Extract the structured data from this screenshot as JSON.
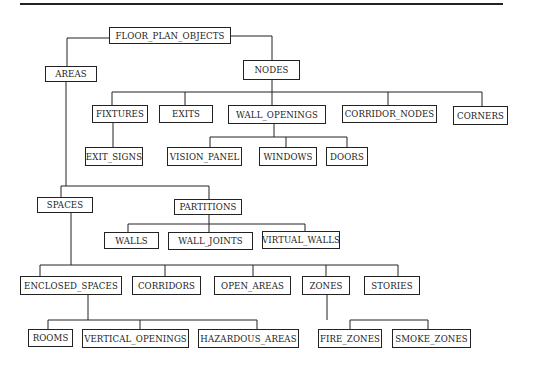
{
  "diagram": {
    "type": "hierarchy-tree",
    "line_color": "#222222",
    "nodes": [
      {
        "id": "floor_plan_objects",
        "label": "FLOOR_PLAN_OBJECTS",
        "x": 109,
        "y": 27,
        "w": 122,
        "h": 17,
        "parent": null
      },
      {
        "id": "areas",
        "label": "AREAS",
        "x": 45,
        "y": 66,
        "w": 52,
        "h": 16,
        "parent": "floor_plan_objects"
      },
      {
        "id": "nodes",
        "label": "NODES",
        "x": 243,
        "y": 60,
        "w": 57,
        "h": 20,
        "parent": "floor_plan_objects"
      },
      {
        "id": "fixtures",
        "label": "FIXTURES",
        "x": 92,
        "y": 105,
        "w": 56,
        "h": 18,
        "parent": "nodes"
      },
      {
        "id": "exits",
        "label": "EXITS",
        "x": 159,
        "y": 105,
        "w": 54,
        "h": 18,
        "parent": "nodes"
      },
      {
        "id": "wall_openings",
        "label": "WALL_OPENINGS",
        "x": 228,
        "y": 105,
        "w": 98,
        "h": 19,
        "parent": "nodes"
      },
      {
        "id": "corridor_nodes",
        "label": "CORRIDOR_NODES",
        "x": 342,
        "y": 105,
        "w": 95,
        "h": 18,
        "parent": "nodes"
      },
      {
        "id": "corners",
        "label": "CORNERS",
        "x": 453,
        "y": 106,
        "w": 55,
        "h": 19,
        "parent": "nodes",
        "thick": true
      },
      {
        "id": "exit_signs",
        "label": "EXIT_SIGNS",
        "x": 85,
        "y": 147,
        "w": 58,
        "h": 19,
        "parent": "fixtures"
      },
      {
        "id": "vision_panel",
        "label": "VISION_PANEL",
        "x": 167,
        "y": 147,
        "w": 75,
        "h": 19,
        "parent": "wall_openings"
      },
      {
        "id": "windows",
        "label": "WINDOWS",
        "x": 259,
        "y": 147,
        "w": 58,
        "h": 19,
        "parent": "wall_openings",
        "thick": true
      },
      {
        "id": "doors",
        "label": "DOORS",
        "x": 326,
        "y": 147,
        "w": 42,
        "h": 19,
        "parent": "wall_openings"
      },
      {
        "id": "spaces",
        "label": "SPACES",
        "x": 37,
        "y": 197,
        "w": 56,
        "h": 16,
        "parent": "areas"
      },
      {
        "id": "partitions",
        "label": "PARTITIONS",
        "x": 174,
        "y": 199,
        "w": 68,
        "h": 16,
        "parent": "areas"
      },
      {
        "id": "walls",
        "label": "WALLS",
        "x": 104,
        "y": 232,
        "w": 55,
        "h": 17,
        "parent": "partitions"
      },
      {
        "id": "wall_joints",
        "label": "WALL_JOINTS",
        "x": 168,
        "y": 232,
        "w": 85,
        "h": 18,
        "parent": "partitions"
      },
      {
        "id": "virtual_walls",
        "label": "VIRTUAL_WALLS",
        "x": 262,
        "y": 231,
        "w": 78,
        "h": 18,
        "parent": "partitions",
        "thick": true
      },
      {
        "id": "enclosed_spaces",
        "label": "ENCLOSED_SPACES",
        "x": 20,
        "y": 276,
        "w": 102,
        "h": 19,
        "parent": "spaces"
      },
      {
        "id": "corridors",
        "label": "CORRIDORS",
        "x": 132,
        "y": 276,
        "w": 69,
        "h": 19,
        "parent": "spaces"
      },
      {
        "id": "open_areas",
        "label": "OPEN_AREAS",
        "x": 214,
        "y": 276,
        "w": 77,
        "h": 19,
        "parent": "spaces"
      },
      {
        "id": "zones",
        "label": "ZONES",
        "x": 302,
        "y": 276,
        "w": 48,
        "h": 19,
        "parent": "spaces"
      },
      {
        "id": "stories",
        "label": "STORIES",
        "x": 364,
        "y": 276,
        "w": 56,
        "h": 19,
        "parent": "spaces"
      },
      {
        "id": "rooms",
        "label": "ROOMS",
        "x": 28,
        "y": 329,
        "w": 45,
        "h": 18,
        "parent": "enclosed_spaces"
      },
      {
        "id": "vertical_openings",
        "label": "VERTICAL_OPENINGS",
        "x": 82,
        "y": 329,
        "w": 107,
        "h": 19,
        "parent": "enclosed_spaces"
      },
      {
        "id": "hazardous_areas",
        "label": "HAZARDOUS_AREAS",
        "x": 198,
        "y": 329,
        "w": 101,
        "h": 19,
        "parent": "enclosed_spaces"
      },
      {
        "id": "fire_zones",
        "label": "FIRE_ZONES",
        "x": 318,
        "y": 329,
        "w": 64,
        "h": 19,
        "parent": "zones"
      },
      {
        "id": "smoke_zones",
        "label": "SMOKE_ZONES",
        "x": 392,
        "y": 329,
        "w": 79,
        "h": 19,
        "parent": "zones"
      }
    ],
    "connectors": [
      {
        "points": [
          [
            109,
            38
          ],
          [
            67,
            38
          ],
          [
            67,
            66
          ]
        ]
      },
      {
        "points": [
          [
            231,
            36
          ],
          [
            272,
            36
          ],
          [
            272,
            60
          ]
        ]
      },
      {
        "points": [
          [
            272,
            80
          ],
          [
            272,
            92
          ]
        ]
      },
      {
        "points": [
          [
            112,
            92
          ],
          [
            482,
            92
          ]
        ]
      },
      {
        "points": [
          [
            112,
            92
          ],
          [
            112,
            105
          ]
        ]
      },
      {
        "points": [
          [
            185,
            92
          ],
          [
            185,
            105
          ]
        ]
      },
      {
        "points": [
          [
            272,
            92
          ],
          [
            272,
            105
          ]
        ]
      },
      {
        "points": [
          [
            388,
            92
          ],
          [
            388,
            105
          ]
        ]
      },
      {
        "points": [
          [
            482,
            92
          ],
          [
            482,
            106
          ]
        ]
      },
      {
        "points": [
          [
            113,
            123
          ],
          [
            113,
            147
          ]
        ]
      },
      {
        "points": [
          [
            274,
            124
          ],
          [
            274,
            137
          ]
        ]
      },
      {
        "points": [
          [
            210,
            137
          ],
          [
            347,
            137
          ]
        ]
      },
      {
        "points": [
          [
            210,
            137
          ],
          [
            210,
            147
          ]
        ]
      },
      {
        "points": [
          [
            286,
            137
          ],
          [
            286,
            147
          ]
        ]
      },
      {
        "points": [
          [
            347,
            137
          ],
          [
            347,
            147
          ]
        ]
      },
      {
        "points": [
          [
            66,
            82
          ],
          [
            66,
            186
          ]
        ]
      },
      {
        "points": [
          [
            61,
            186
          ],
          [
            209,
            186
          ]
        ]
      },
      {
        "points": [
          [
            61,
            186
          ],
          [
            61,
            197
          ]
        ]
      },
      {
        "points": [
          [
            209,
            186
          ],
          [
            209,
            199
          ]
        ]
      },
      {
        "points": [
          [
            209,
            215
          ],
          [
            209,
            224
          ]
        ]
      },
      {
        "points": [
          [
            128,
            224
          ],
          [
            305,
            224
          ]
        ]
      },
      {
        "points": [
          [
            128,
            224
          ],
          [
            128,
            232
          ]
        ]
      },
      {
        "points": [
          [
            209,
            224
          ],
          [
            209,
            232
          ]
        ]
      },
      {
        "points": [
          [
            305,
            224
          ],
          [
            305,
            231
          ]
        ]
      },
      {
        "points": [
          [
            71,
            213
          ],
          [
            71,
            265
          ]
        ]
      },
      {
        "points": [
          [
            40,
            265
          ],
          [
            398,
            265
          ]
        ]
      },
      {
        "points": [
          [
            40,
            265
          ],
          [
            40,
            276
          ]
        ]
      },
      {
        "points": [
          [
            165,
            265
          ],
          [
            165,
            276
          ]
        ]
      },
      {
        "points": [
          [
            253,
            265
          ],
          [
            253,
            276
          ]
        ]
      },
      {
        "points": [
          [
            326,
            265
          ],
          [
            326,
            276
          ]
        ]
      },
      {
        "points": [
          [
            398,
            265
          ],
          [
            398,
            276
          ]
        ]
      },
      {
        "points": [
          [
            88,
            295
          ],
          [
            88,
            320
          ]
        ]
      },
      {
        "points": [
          [
            48,
            320
          ],
          [
            257,
            320
          ]
        ]
      },
      {
        "points": [
          [
            48,
            320
          ],
          [
            48,
            329
          ]
        ]
      },
      {
        "points": [
          [
            140,
            320
          ],
          [
            140,
            329
          ]
        ]
      },
      {
        "points": [
          [
            257,
            320
          ],
          [
            257,
            329
          ]
        ]
      },
      {
        "points": [
          [
            327,
            295
          ],
          [
            327,
            320
          ]
        ]
      },
      {
        "points": [
          [
            350,
            320
          ],
          [
            428,
            320
          ]
        ]
      },
      {
        "points": [
          [
            350,
            320
          ],
          [
            350,
            329
          ]
        ]
      },
      {
        "points": [
          [
            428,
            320
          ],
          [
            428,
            329
          ]
        ]
      }
    ]
  }
}
